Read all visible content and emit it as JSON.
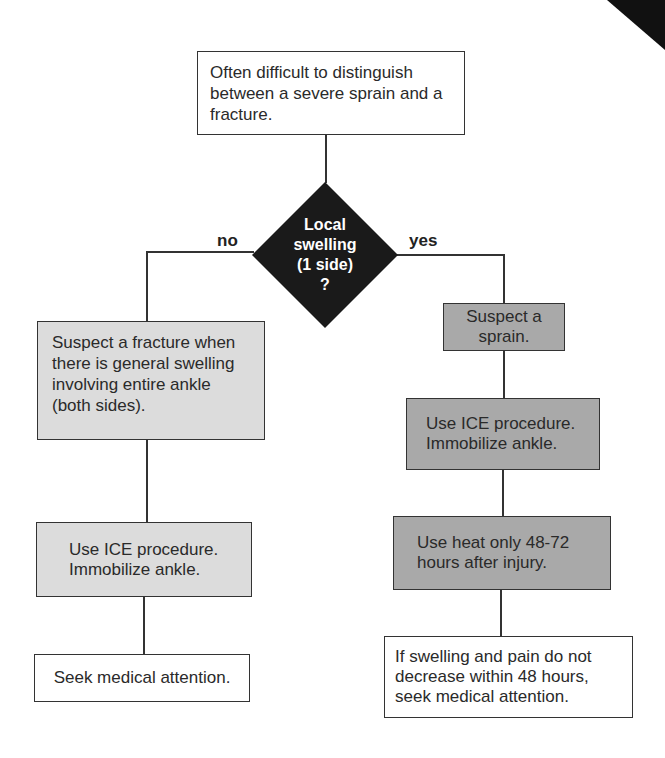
{
  "flowchart": {
    "start": "Often difficult to distinguish between a severe sprain and a fracture.",
    "decision": {
      "lines": [
        "Local",
        "swelling",
        "(1 side)",
        "?"
      ],
      "no_label": "no",
      "yes_label": "yes"
    },
    "no_branch": [
      "Suspect a fracture when there is general swelling involving entire ankle (both sides).",
      "Use ICE procedure. Immobilize ankle.",
      "Seek medical attention."
    ],
    "yes_branch": [
      "Suspect a sprain.",
      "Use ICE procedure. Immobilize ankle.",
      "Use heat only 48-72 hours after injury.",
      "If swelling and pain do not decrease within 48 hours, seek medical attention."
    ]
  },
  "colors": {
    "decision_fill": "#1a1a1a",
    "no_branch_fill": "#dcdcdc",
    "yes_branch_fill": "#a9a9a9",
    "terminal_fill": "#ffffff"
  }
}
